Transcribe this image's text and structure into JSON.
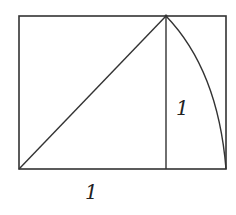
{
  "diagram": {
    "stroke_color": "#333333",
    "background": "#ffffff",
    "labels": {
      "base": "1",
      "side": "1"
    },
    "geometry": {
      "outer_rect": {
        "x1": 19,
        "y1": 16,
        "x2": 226,
        "y2": 169
      },
      "square_right_x": 166,
      "diagonal": {
        "from": [
          19,
          169
        ],
        "to": [
          166,
          16
        ]
      },
      "arc": {
        "center": [
          19,
          169
        ],
        "from": [
          166,
          16
        ],
        "to": [
          226,
          169
        ]
      }
    }
  }
}
